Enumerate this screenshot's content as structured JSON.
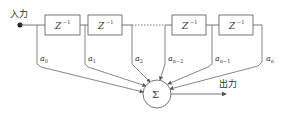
{
  "diagram": {
    "input_label": "入力",
    "output_label": "出力",
    "delay_label": "Z",
    "delay_exp": "−1",
    "sum_symbol": "Σ",
    "coefficients": [
      {
        "base": "a",
        "sub": "0"
      },
      {
        "base": "a",
        "sub": "1"
      },
      {
        "base": "a",
        "sub": "2"
      },
      {
        "base": "a",
        "sub": "n−2"
      },
      {
        "base": "a",
        "sub": "n−1"
      },
      {
        "base": "a",
        "sub": "n"
      }
    ],
    "colors": {
      "line": "#555555",
      "text": "#333333",
      "background": "#ffffff"
    }
  }
}
